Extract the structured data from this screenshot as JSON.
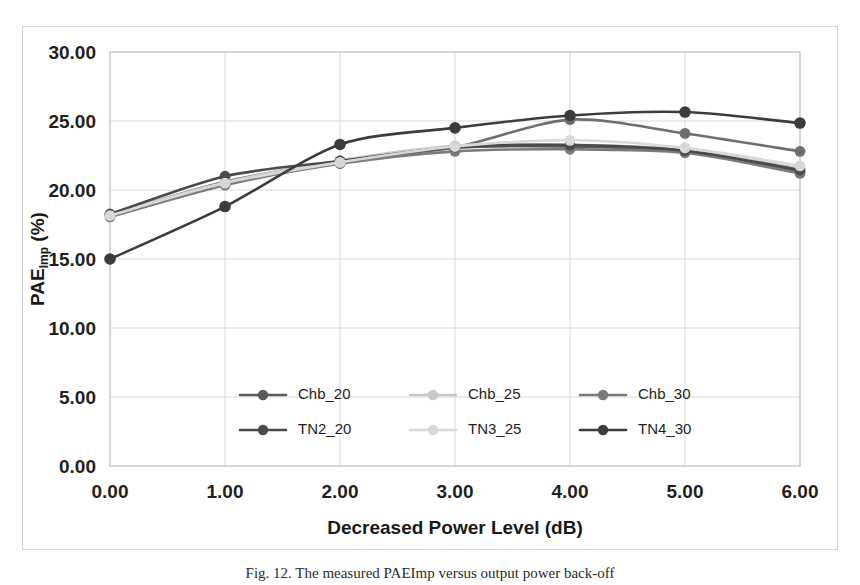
{
  "figure": {
    "caption": "Fig. 12.  The measured PAEImp versus output power back-off",
    "background_color": "#ffffff",
    "frame_color": "#d3d3d3"
  },
  "chart_data": {
    "type": "line",
    "title": "",
    "subtitle": "",
    "xlabel": "Decreased Power Level (dB)",
    "ylabel_main": "PAE",
    "ylabel_sub": "Imp",
    "ylabel_unit": " (%)",
    "ylabel": "PAEImp (%)",
    "x": [
      0.0,
      1.0,
      2.0,
      3.0,
      4.0,
      5.0,
      6.0
    ],
    "xtick_labels": [
      "0.00",
      "1.00",
      "2.00",
      "3.00",
      "4.00",
      "5.00",
      "6.00"
    ],
    "ytick_labels": [
      "0.00",
      "5.00",
      "10.00",
      "15.00",
      "20.00",
      "25.00",
      "30.00"
    ],
    "ytick_values": [
      0,
      5,
      10,
      15,
      20,
      25,
      30
    ],
    "xlim": [
      0,
      6
    ],
    "ylim": [
      0,
      30
    ],
    "grid": true,
    "grid_axis": "both",
    "legend_position": "inside-lower-center",
    "legend_columns": 3,
    "legend_rows": 2,
    "marker": "circle",
    "series": [
      {
        "name": "Chb_20",
        "color": "#5a5a5a",
        "line_width": 2.6,
        "marker_size": 5.4,
        "values": [
          18.2,
          20.45,
          22.05,
          23.05,
          23.15,
          22.75,
          21.35
        ]
      },
      {
        "name": "Chb_25",
        "color": "#c8c8c8",
        "line_width": 2.6,
        "marker_size": 5.4,
        "values": [
          18.3,
          20.55,
          22.15,
          23.2,
          23.3,
          22.9,
          21.55
        ]
      },
      {
        "name": "Chb_30",
        "color": "#7a7a7a",
        "line_width": 2.6,
        "marker_size": 5.4,
        "values": [
          18.05,
          20.35,
          21.9,
          22.8,
          22.95,
          22.7,
          21.2
        ]
      },
      {
        "name": "TN2_20",
        "color": "#4a4a4a",
        "line_width": 2.6,
        "marker_size": 5.4,
        "values": [
          18.25,
          21.0,
          22.1,
          23.1,
          23.25,
          22.85,
          21.45
        ]
      },
      {
        "name": "TN3_25",
        "color": "#d8d8d8",
        "line_width": 2.6,
        "marker_size": 5.4,
        "values": [
          18.15,
          20.5,
          22.0,
          23.15,
          23.6,
          23.05,
          21.75
        ]
      },
      {
        "name": "TN4_30",
        "color": "#3c3c3c",
        "line_width": 2.6,
        "marker_size": 5.8,
        "values": [
          15.0,
          18.8,
          23.3,
          24.5,
          25.4,
          25.65,
          24.85
        ]
      }
    ],
    "extra_series": [
      {
        "name": "Chb_30_upper",
        "color": "#6e6e6e",
        "line_width": 2.6,
        "marker_size": 5.4,
        "values": [
          18.22,
          20.6,
          22.08,
          23.1,
          25.1,
          24.1,
          22.8
        ]
      }
    ]
  },
  "legend": {
    "entries": [
      {
        "label": "Chb_20",
        "color": "#5a5a5a"
      },
      {
        "label": "Chb_25",
        "color": "#c8c8c8"
      },
      {
        "label": "Chb_30",
        "color": "#7a7a7a"
      },
      {
        "label": "TN2_20",
        "color": "#4a4a4a"
      },
      {
        "label": "TN3_25",
        "color": "#d8d8d8"
      },
      {
        "label": "TN4_30",
        "color": "#3c3c3c"
      }
    ]
  }
}
